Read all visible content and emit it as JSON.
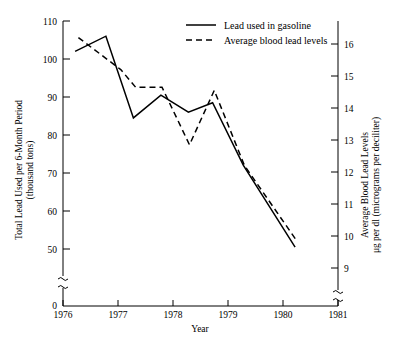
{
  "chart_data": {
    "type": "line",
    "title": "",
    "xlabel": "Year",
    "grid": false,
    "legend_position": "top-center",
    "x_axis": {
      "label": "Year",
      "ticks": [
        1976,
        1977,
        1978,
        1979,
        1980,
        1981
      ],
      "tick_labels": [
        "1976",
        "1977",
        "1978",
        "1979",
        "1980",
        "1981"
      ],
      "xlim": [
        1976,
        1981
      ]
    },
    "y_axis_left": {
      "label_line1": "Total Lead Used per 6-Month Period",
      "label_line2": "(thousand tons)",
      "ticks": [
        50,
        60,
        70,
        80,
        90,
        100,
        110
      ],
      "tick_labels": [
        "50",
        "60",
        "70",
        "80",
        "90",
        "100",
        "110"
      ],
      "zero_label": "0",
      "ylim": [
        50,
        110
      ],
      "axis_break": true
    },
    "y_axis_right": {
      "label_line1": "Average Blood Lead Levels",
      "label_line2": "μg per dl (micrograms per deciliter)",
      "ticks": [
        9,
        10,
        11,
        12,
        13,
        14,
        15,
        16
      ],
      "tick_labels": [
        "9",
        "10",
        "11",
        "12",
        "13",
        "14",
        "15",
        "16"
      ],
      "ylim": [
        9,
        16
      ],
      "axis_break": true
    },
    "series": [
      {
        "name": "Lead used in gasoline",
        "style": "solid",
        "axis": "left",
        "units": "thousand tons per 6-month period",
        "x": [
          1976.22,
          1976.78,
          1977.28,
          1977.78,
          1978.28,
          1978.72,
          1979.28,
          1980.22
        ],
        "values": [
          102.0,
          106.0,
          84.5,
          90.5,
          86.0,
          88.5,
          72.0,
          50.5
        ]
      },
      {
        "name": "Average blood lead levels",
        "style": "dashed",
        "axis": "right",
        "units": "μg per dl",
        "x": [
          1976.28,
          1977.05,
          1977.32,
          1977.8,
          1978.3,
          1978.75,
          1979.3,
          1980.25
        ],
        "values": [
          16.2,
          15.2,
          14.65,
          14.65,
          12.85,
          14.55,
          12.2,
          9.85
        ]
      }
    ],
    "legend": [
      {
        "label": "Lead used in gasoline",
        "style": "solid"
      },
      {
        "label": "Average blood lead levels",
        "style": "dashed"
      }
    ]
  }
}
